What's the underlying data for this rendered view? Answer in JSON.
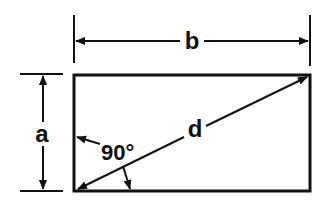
{
  "diagram": {
    "type": "rectangle-dimensions",
    "colors": {
      "stroke": "#111111",
      "background": "#ffffff"
    },
    "labels": {
      "width": "b",
      "height": "a",
      "diagonal": "d",
      "angle": "90°"
    }
  }
}
